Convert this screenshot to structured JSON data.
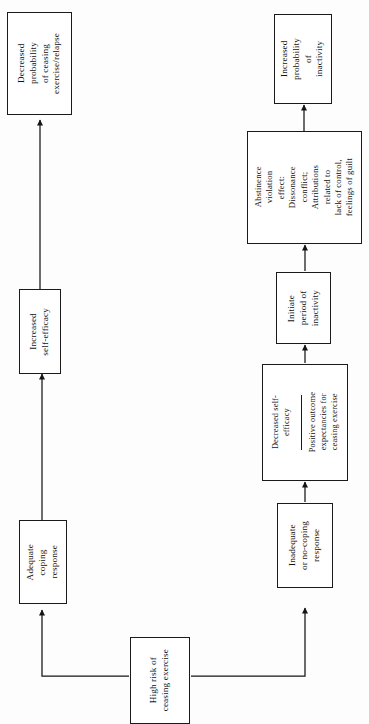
{
  "diagram": {
    "orientation": "rotated-90-ccw",
    "background_color": "#fdfdfd",
    "line_color": "#1a1a1a",
    "nodes": [
      {
        "id": "high-risk",
        "label": "High risk of\nceasing exercise"
      },
      {
        "id": "adequate-coping",
        "label": "Adequate\ncoping\nresponse"
      },
      {
        "id": "increased-self-efficacy",
        "label": "Increased\nself-efficacy"
      },
      {
        "id": "decreased-prob-relapse",
        "label": "Decreased\nprobability\nof ceasing\nexercise/relapse"
      },
      {
        "id": "inadequate-coping",
        "label": "Inadequate\nor no-coping\nresponse"
      },
      {
        "id": "decreased-self-efficacy",
        "label": "Decreased self-\nefficacy"
      },
      {
        "id": "positive-outcome-expectancies",
        "label": "Positive outcome\nexpectancies for\nceasing exercise"
      },
      {
        "id": "initiate-inactivity",
        "label": "Initiate\nperiod of\ninactivity"
      },
      {
        "id": "abstinence-violation-effect",
        "label": "Abstinence\nviolation\neffect:\nDissonance\nconflict;\nAttributions\nrelated to\nlack of control,\nfeelings of guilt"
      },
      {
        "id": "increased-prob-inactivity",
        "label": "Increased\nprobability\nof\ninactivity"
      }
    ],
    "edges": [
      {
        "from": "high-risk",
        "to": "adequate-coping"
      },
      {
        "from": "high-risk",
        "to": "inadequate-coping"
      },
      {
        "from": "adequate-coping",
        "to": "increased-self-efficacy"
      },
      {
        "from": "increased-self-efficacy",
        "to": "decreased-prob-relapse"
      },
      {
        "from": "inadequate-coping",
        "to": "decreased-self-efficacy"
      },
      {
        "from": "decreased-self-efficacy",
        "to": "initiate-inactivity"
      },
      {
        "from": "initiate-inactivity",
        "to": "abstinence-violation-effect"
      },
      {
        "from": "abstinence-violation-effect",
        "to": "increased-prob-inactivity"
      }
    ]
  }
}
